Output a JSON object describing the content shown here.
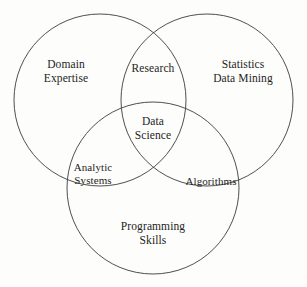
{
  "figure": {
    "background_color": "#fdfdfb",
    "stroke_color": "#3b3b3b",
    "text_color": "#1d1d1d"
  },
  "diagram": {
    "type": "venn",
    "set_count": 3,
    "circles": [
      {
        "name": "domain-expertise-circle",
        "cx": 100,
        "cy": 100,
        "r": 86
      },
      {
        "name": "statistics-data-mining-circle",
        "cx": 207,
        "cy": 100,
        "r": 86
      },
      {
        "name": "programming-skills-circle",
        "cx": 153,
        "cy": 188,
        "r": 86
      }
    ],
    "labels": {
      "domain_expertise": "Domain\nExpertise",
      "statistics_data_mining": "Statistics\nData Mining",
      "programming_skills": "Programming\nSkills",
      "research": "Research",
      "analytic_systems": "Analytic\nSystems",
      "algorithms": "Algorithms",
      "data_science": "Data\nScience"
    },
    "regions": [
      {
        "id": "domain-expertise",
        "kind": "set",
        "label": "Domain Expertise",
        "x": 66,
        "y": 72
      },
      {
        "id": "statistics-data-mining",
        "kind": "set",
        "label": "Statistics Data Mining",
        "x": 243,
        "y": 72
      },
      {
        "id": "programming-skills",
        "kind": "set",
        "label": "Programming Skills",
        "x": 153,
        "y": 234
      },
      {
        "id": "research",
        "kind": "intersection",
        "label": "Research",
        "x": 153,
        "y": 69
      },
      {
        "id": "analytic-systems",
        "kind": "intersection",
        "label": "Analytic Systems",
        "x": 93,
        "y": 174
      },
      {
        "id": "algorithms",
        "kind": "intersection",
        "label": "Algorithms",
        "x": 211,
        "y": 181
      },
      {
        "id": "data-science",
        "kind": "center-intersection",
        "label": "Data Science",
        "x": 153,
        "y": 129
      }
    ]
  }
}
